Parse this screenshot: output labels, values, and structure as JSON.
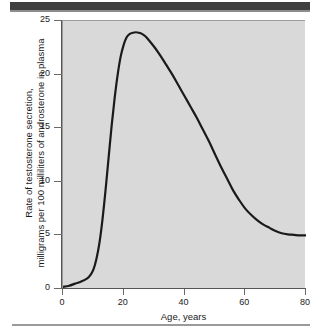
{
  "figure": {
    "top_bar_name": "decorative-top-bar",
    "bottom_rule_name": "decorative-bottom-rule"
  },
  "chart_data": {
    "type": "line",
    "title": "",
    "xlabel": "Age, years",
    "ylabel_line1": "Rate of testosterone secretion,",
    "ylabel_line2": "milligrams per 100 milliliters of androsterone in plasma",
    "xlim": [
      0,
      80
    ],
    "ylim": [
      0,
      25
    ],
    "xticks": [
      0,
      20,
      40,
      60,
      80
    ],
    "xtick_labels": [
      "0",
      "20",
      "40",
      "60",
      "80"
    ],
    "yticks": [
      0,
      5,
      10,
      15,
      20,
      25
    ],
    "ytick_labels": [
      "0",
      "5",
      "10",
      "15",
      "20",
      "25"
    ],
    "grid": false,
    "legend": false,
    "line_color": "#1a1a1a",
    "line_width": 2.2,
    "plot_background": "#d9d9d9",
    "series": [
      {
        "name": "Rate of testosterone secretion",
        "x": [
          0,
          2,
          4,
          6,
          8,
          9,
          10,
          11,
          12,
          13,
          14,
          15,
          16,
          17,
          18,
          19,
          20,
          21,
          22,
          23,
          24,
          25,
          26,
          27,
          28,
          30,
          32,
          34,
          36,
          38,
          40,
          42,
          44,
          46,
          48,
          50,
          52,
          54,
          56,
          58,
          60,
          62,
          64,
          66,
          68,
          70,
          72,
          74,
          76,
          78,
          80
        ],
        "y": [
          0.2,
          0.3,
          0.5,
          0.7,
          1.0,
          1.3,
          1.8,
          2.8,
          4.3,
          6.5,
          9.2,
          12.2,
          15.2,
          17.8,
          20.0,
          21.7,
          22.8,
          23.5,
          23.8,
          23.9,
          23.95,
          23.9,
          23.8,
          23.6,
          23.3,
          22.6,
          21.8,
          20.9,
          20.0,
          19.0,
          18.0,
          17.0,
          16.0,
          14.9,
          13.8,
          12.6,
          11.4,
          10.3,
          9.2,
          8.3,
          7.5,
          6.9,
          6.4,
          6.0,
          5.7,
          5.4,
          5.2,
          5.1,
          5.05,
          5.0,
          5.0
        ]
      }
    ]
  }
}
